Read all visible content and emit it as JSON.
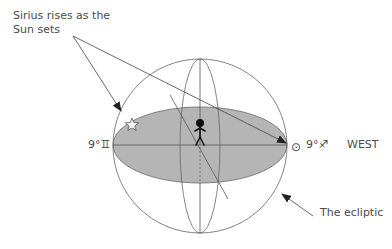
{
  "diagram": {
    "caption": "Sirius rises as the Sun sets",
    "east_marker": "9°♊",
    "west_marker": "9°♐",
    "sun_symbol": "⊙",
    "direction_label": "WEST",
    "ecliptic_label": "The ecliptic",
    "star_symbol": "☆",
    "colors": {
      "line": "#555555",
      "ecliptic_fill": "#b5b5b5",
      "figure": "#111111",
      "text": "#4a4a4a"
    }
  }
}
